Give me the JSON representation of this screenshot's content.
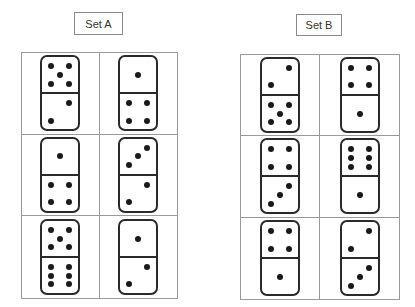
{
  "sets": [
    {
      "label": "Set A",
      "dominoes": [
        {
          "top": 5,
          "bottom": 2
        },
        {
          "top": 1,
          "bottom": 4
        },
        {
          "top": 1,
          "bottom": 4
        },
        {
          "top": 3,
          "bottom": 2
        },
        {
          "top": 5,
          "bottom": 6
        },
        {
          "top": 1,
          "bottom": 2
        }
      ]
    },
    {
      "label": "Set B",
      "dominoes": [
        {
          "top": 2,
          "bottom": 5
        },
        {
          "top": 4,
          "bottom": 1
        },
        {
          "top": 4,
          "bottom": 3
        },
        {
          "top": 6,
          "bottom": 1
        },
        {
          "top": 4,
          "bottom": 1
        },
        {
          "top": 2,
          "bottom": 3
        }
      ]
    }
  ],
  "colors": {
    "grid_line": "#9a9a9a",
    "domino_border": "#2a2a2a",
    "pip": "#1a1a1a"
  }
}
